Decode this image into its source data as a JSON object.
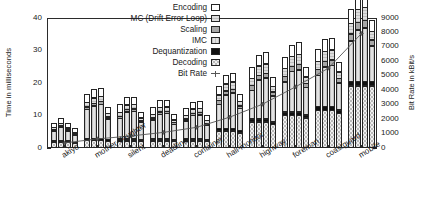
{
  "chart_data": {
    "type": "bar",
    "title": "",
    "ylabel": "Time in milliseconds",
    "ylabel_right": "Bit Rate in kBit/s",
    "xlabel": "",
    "ylim": [
      0,
      40
    ],
    "ylim_right": [
      0,
      9000
    ],
    "yticks": [
      0,
      10,
      20,
      30,
      40
    ],
    "yticks_right": [
      0,
      1000,
      2000,
      3000,
      4000,
      5000,
      6000,
      7000,
      8000,
      9000
    ],
    "grid": false,
    "legend_position": "upper center",
    "stacked": true,
    "bars_per_group": 4,
    "categories": [
      "akiyo",
      "mother-daughter",
      "silent",
      "deadline",
      "container",
      "hall-monitor",
      "highway",
      "foreman",
      "coastguard",
      "mobile"
    ],
    "legend": [
      {
        "label": "Encoding",
        "swatch": "white"
      },
      {
        "label": "MC (Drift Error Loop)",
        "swatch": "light-gray-hlines"
      },
      {
        "label": "Scaling",
        "swatch": "medium-gray"
      },
      {
        "label": "IMC",
        "swatch": "light-gray-vlines"
      },
      {
        "label": "Dequantization",
        "swatch": "black"
      },
      {
        "label": "Decoding",
        "swatch": "crosshatch"
      },
      {
        "label": "Bit Rate",
        "swatch": "line-marker"
      }
    ],
    "series": [
      {
        "name": "Decoding",
        "values": [
          [
            1.6,
            1.6,
            1.6,
            1.3
          ],
          [
            2.2,
            2.2,
            2.2,
            2.0
          ],
          [
            2.1,
            2.1,
            2.1,
            1.9
          ],
          [
            2.1,
            2.1,
            2.1,
            1.9
          ],
          [
            2.1,
            2.1,
            2.1,
            1.9
          ],
          [
            5.2,
            5.2,
            5.2,
            4.6
          ],
          [
            8.0,
            8.0,
            8.0,
            7.2
          ],
          [
            10.0,
            10.0,
            10.0,
            9.2
          ],
          [
            11.6,
            11.6,
            11.6,
            10.6
          ],
          [
            19.0,
            19.0,
            19.0,
            19.0
          ]
        ]
      },
      {
        "name": "Dequantization",
        "values": [
          [
            0.7,
            0.7,
            0.7,
            0.6
          ],
          [
            0.8,
            0.8,
            0.8,
            0.7
          ],
          [
            0.8,
            0.8,
            0.8,
            0.7
          ],
          [
            0.8,
            0.8,
            0.8,
            0.7
          ],
          [
            0.8,
            0.8,
            0.8,
            0.7
          ],
          [
            1.0,
            1.0,
            1.0,
            0.9
          ],
          [
            1.1,
            1.1,
            1.1,
            1.0
          ],
          [
            1.2,
            1.2,
            1.2,
            1.1
          ],
          [
            1.3,
            1.3,
            1.3,
            1.2
          ],
          [
            1.7,
            1.7,
            1.7,
            1.7
          ]
        ]
      },
      {
        "name": "IMC",
        "values": [
          [
            3.3,
            4.4,
            3.1,
            2.4
          ],
          [
            9.1,
            10.3,
            10.8,
            6.6
          ],
          [
            6.5,
            8.5,
            8.7,
            5.5
          ],
          [
            6.0,
            7.8,
            8.0,
            5.0
          ],
          [
            5.7,
            7.4,
            7.6,
            4.8
          ],
          [
            7.6,
            10.5,
            11.0,
            7.0
          ],
          [
            9.0,
            12.2,
            12.8,
            8.2
          ],
          [
            9.5,
            12.6,
            13.2,
            8.7
          ],
          [
            9.8,
            12.4,
            12.8,
            8.6
          ],
          [
            12.5,
            16.0,
            16.6,
            11.0
          ]
        ]
      },
      {
        "name": "Scaling",
        "values": [
          [
            0.5,
            0.5,
            0.5,
            0.4
          ],
          [
            1.0,
            1.0,
            1.0,
            0.8
          ],
          [
            0.9,
            0.9,
            0.9,
            0.7
          ],
          [
            0.9,
            0.9,
            0.9,
            0.7
          ],
          [
            0.9,
            0.9,
            0.9,
            0.7
          ],
          [
            1.3,
            1.3,
            1.3,
            1.0
          ],
          [
            1.6,
            1.6,
            1.6,
            1.3
          ],
          [
            1.8,
            1.8,
            1.8,
            1.4
          ],
          [
            1.9,
            1.9,
            1.9,
            1.5
          ],
          [
            2.4,
            2.4,
            2.4,
            2.0
          ]
        ]
      },
      {
        "name": "MC (Drift Error Loop)",
        "values": [
          [
            0.8,
            1.0,
            0.8,
            0.6
          ],
          [
            1.6,
            1.8,
            1.8,
            1.2
          ],
          [
            1.4,
            1.6,
            1.6,
            1.1
          ],
          [
            1.3,
            1.5,
            1.5,
            1.0
          ],
          [
            1.3,
            1.5,
            1.5,
            1.0
          ],
          [
            1.9,
            2.4,
            2.5,
            1.6
          ],
          [
            2.4,
            3.0,
            3.1,
            2.0
          ],
          [
            2.6,
            3.2,
            3.3,
            2.2
          ],
          [
            2.7,
            3.2,
            3.3,
            2.2
          ],
          [
            3.4,
            4.2,
            4.3,
            2.9
          ]
        ]
      },
      {
        "name": "Encoding",
        "values": [
          [
            1.6,
            1.6,
            1.6,
            1.3
          ],
          [
            2.8,
            2.8,
            2.8,
            2.2
          ],
          [
            2.5,
            2.5,
            2.5,
            2.0
          ],
          [
            2.4,
            2.4,
            2.4,
            1.9
          ],
          [
            2.4,
            2.4,
            2.4,
            1.9
          ],
          [
            3.0,
            3.0,
            3.0,
            2.4
          ],
          [
            3.6,
            3.6,
            3.6,
            2.9
          ],
          [
            3.8,
            3.8,
            3.8,
            3.0
          ],
          [
            3.9,
            3.9,
            3.9,
            3.1
          ],
          [
            4.5,
            4.5,
            4.5,
            3.6
          ]
        ]
      }
    ],
    "bit_rate": {
      "name": "Bit Rate",
      "units": "kBit/s",
      "values": [
        420,
        700,
        900,
        1150,
        1500,
        2200,
        3100,
        4300,
        5600,
        8000
      ]
    }
  },
  "colors": {
    "encoding": "#ffffff",
    "mc": "#dedede",
    "scaling": "#a8a8a8",
    "imc": "#e2e2e2",
    "dequantization": "#111111",
    "decoding": "#efefef",
    "axis": "#2b2b2b",
    "line": "#555555"
  }
}
